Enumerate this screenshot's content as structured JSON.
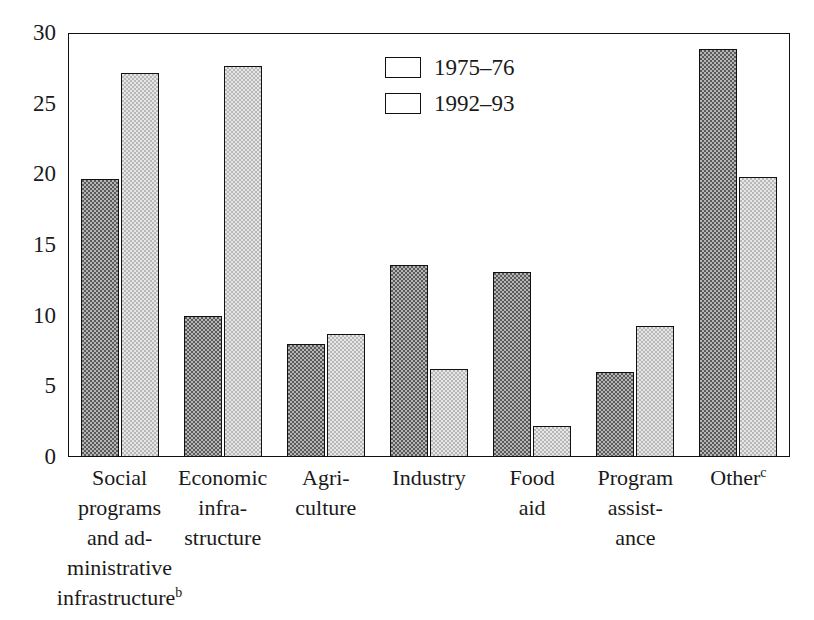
{
  "chart_data": {
    "type": "bar",
    "title": "",
    "xlabel": "",
    "ylabel": "",
    "ylim": [
      0,
      30
    ],
    "yticks": [
      0,
      5,
      10,
      15,
      20,
      25,
      30
    ],
    "grid": false,
    "legend_position": "top-center",
    "categories": [
      "Social programs and ad-ministrative infrastructure",
      "Economic infrastructure",
      "Agriculture",
      "Industry",
      "Food aid",
      "Program assistance",
      "Other"
    ],
    "category_lines": [
      [
        "Social",
        "programs",
        "and ad-",
        "ministrative",
        "infrastructure"
      ],
      [
        "Economic",
        "infra-",
        "structure"
      ],
      [
        "Agri-",
        "culture"
      ],
      [
        "Industry"
      ],
      [
        "Food",
        "aid"
      ],
      [
        "Program",
        "assist-",
        "ance"
      ],
      [
        "Other"
      ]
    ],
    "category_footnotes": [
      "b",
      "",
      "",
      "",
      "",
      "",
      "c"
    ],
    "series": [
      {
        "name": "1975–76",
        "color": "#5a5a5a",
        "values": [
          19.7,
          10.0,
          8.0,
          13.6,
          13.1,
          6.0,
          28.9
        ]
      },
      {
        "name": "1992–93",
        "color": "#e6e6e6",
        "values": [
          27.2,
          27.7,
          8.7,
          6.2,
          2.2,
          9.3,
          19.8
        ]
      }
    ]
  },
  "legend": {
    "items": [
      {
        "label": "1975–76"
      },
      {
        "label": "1992–93"
      }
    ]
  },
  "yticks": [
    {
      "label": "30"
    },
    {
      "label": "25"
    },
    {
      "label": "20"
    },
    {
      "label": "15"
    },
    {
      "label": "10"
    },
    {
      "label": "5"
    },
    {
      "label": "0"
    }
  ]
}
